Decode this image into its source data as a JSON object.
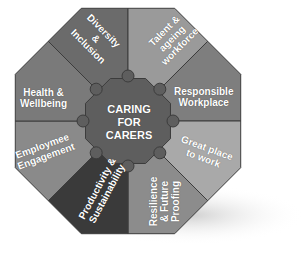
{
  "diagram": {
    "center": {
      "lines": [
        "CARING",
        "FOR",
        "CARERS"
      ]
    },
    "segments": [
      {
        "id": "diversity-inclusion",
        "lines": [
          "Diversity",
          "&",
          "Inclusion"
        ],
        "color": "#6b6b6b"
      },
      {
        "id": "talent-ageing-workforce",
        "lines": [
          "Talent &",
          "ageing",
          "workforce"
        ],
        "color": "#9a9a9a"
      },
      {
        "id": "responsible-workplace",
        "lines": [
          "Responsible",
          "Workplace"
        ],
        "color": "#7e7e7e"
      },
      {
        "id": "great-place-to-work",
        "lines": [
          "Great place",
          "to work"
        ],
        "color": "#a9a9a9"
      },
      {
        "id": "resilience-future-proofing",
        "lines": [
          "Resilience",
          "& Future",
          "Proofing"
        ],
        "color": "#8c8c8c"
      },
      {
        "id": "productivity-sustainability",
        "lines": [
          "Productivity &",
          "Sustainability"
        ],
        "color": "#3a3a3a"
      },
      {
        "id": "employee-engagement",
        "lines": [
          "Employmee",
          "Engagement"
        ],
        "color": "#8a8a8a"
      },
      {
        "id": "health-wellbeing",
        "lines": [
          "Health &",
          "Wellbeing"
        ],
        "color": "#7a7a7a"
      }
    ],
    "center_color": "#5e5e5e",
    "border_color": "#3c3c3c",
    "shadow_color": "#d9d9d9"
  }
}
